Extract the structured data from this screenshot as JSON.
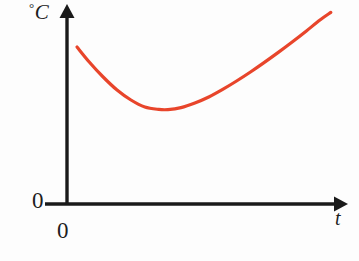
{
  "figure": {
    "kind": "line-graph",
    "background_color": "#fdfdfd",
    "width": 359,
    "height": 261
  },
  "labels": {
    "y_axis_degree_symbol": "°",
    "y_axis_unit": "C",
    "y_axis_origin_zero": "0",
    "x_axis_origin_zero": "0",
    "x_axis_variable": "t"
  },
  "colors": {
    "curve": "#e8452b",
    "axis": "#1a1a1a",
    "text": "#1e1e1e"
  },
  "chart_data": {
    "type": "line",
    "title": "",
    "xlabel": "t",
    "ylabel": "°C",
    "grid": false,
    "legend": null,
    "annotations": [
      {
        "text": "0",
        "role": "y-axis-origin-tick"
      },
      {
        "text": "0",
        "role": "x-axis-origin-tick"
      }
    ],
    "axis_style": {
      "x_axis_arrow": true,
      "y_axis_arrow": true,
      "tick_marks": false,
      "tick_labels": [
        "0"
      ]
    },
    "xlim": [
      0,
      100
    ],
    "ylim": [
      0,
      100
    ],
    "series": [
      {
        "name": "temperature",
        "color": "#e8452b",
        "shape": "u-shaped-curve-with-minimum",
        "x": [
          3.6,
          8.0,
          13.0,
          18.0,
          23.0,
          28.0,
          33.0,
          36.3,
          41.0,
          46.0,
          51.0,
          56.0,
          61.0,
          66.0,
          71.0,
          76.0,
          81.0,
          86.0,
          91.0,
          94.9
        ],
        "y": [
          78.5,
          71.0,
          63.5,
          57.0,
          52.0,
          48.5,
          47.3,
          47.2,
          48.2,
          50.5,
          53.5,
          57.3,
          61.5,
          66.0,
          70.8,
          75.8,
          81.0,
          86.4,
          92.0,
          95.8
        ],
        "minimum_point": {
          "x": 36.3,
          "y": 47.2
        },
        "start_point": {
          "x": 3.6,
          "y": 78.5
        },
        "end_point": {
          "x": 94.9,
          "y": 95.8
        }
      }
    ]
  }
}
